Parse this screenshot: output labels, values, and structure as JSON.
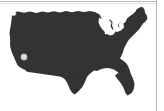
{
  "image": {
    "kind": "map-thumbnail",
    "width": 164,
    "height": 111,
    "background_color": "#ffffff",
    "alt_text": "United States silhouette map"
  },
  "map": {
    "title": "United States",
    "region": "Contiguous United States",
    "projection_look": "simplified outline silhouette",
    "fill_color": "#333333",
    "stroke_color": "#333333",
    "water_cutout_color": "#ffffff",
    "cutouts": [
      {
        "name": "great-lakes",
        "color": "#ffffff"
      }
    ],
    "markers": [
      {
        "name": "location-marker",
        "label": "",
        "x": 24,
        "y": 57,
        "radius": 3.2,
        "fill_color": "#dedede",
        "stroke_color": "#9a9a9a"
      }
    ]
  },
  "rules": {
    "top_line_color": "#b9b9b9",
    "top_line_color_secondary": "#e2e2e2",
    "right_line_color": "#b5b5b5"
  }
}
